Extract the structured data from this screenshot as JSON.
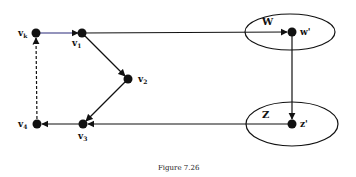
{
  "diagram": {
    "caption": "Figure 7.26",
    "colors": {
      "line": "#111111",
      "blue_edge": "#2a2a7a",
      "node": "#111111",
      "background": "#ffffff"
    },
    "nodes": [
      {
        "id": "vk",
        "label": "v",
        "sub": "k",
        "x": 36,
        "y": 33
      },
      {
        "id": "v1",
        "label": "v",
        "sub": "1",
        "x": 82,
        "y": 33
      },
      {
        "id": "v2",
        "label": "v",
        "sub": "2",
        "x": 128,
        "y": 79
      },
      {
        "id": "v3",
        "label": "v",
        "sub": "3",
        "x": 83,
        "y": 124
      },
      {
        "id": "v4",
        "label": "v",
        "sub": "4",
        "x": 37,
        "y": 124
      },
      {
        "id": "w_prime",
        "label": "w'",
        "x": 292,
        "y": 32
      },
      {
        "id": "z_prime",
        "label": "z'",
        "x": 292,
        "y": 124
      }
    ],
    "regions": [
      {
        "id": "W",
        "label": "W",
        "cx": 290,
        "cy": 32,
        "rx": 45,
        "ry": 18
      },
      {
        "id": "Z",
        "label": "Z",
        "cx": 292,
        "cy": 124,
        "rx": 46,
        "ry": 22
      }
    ],
    "edges": [
      {
        "from": "vk",
        "to": "v1",
        "style": "solid",
        "color": "blue"
      },
      {
        "from": "v1",
        "to": "w_prime",
        "style": "solid"
      },
      {
        "from": "v1",
        "to": "v2",
        "style": "solid"
      },
      {
        "from": "v2",
        "to": "v3",
        "style": "solid"
      },
      {
        "from": "w_prime",
        "to": "z_prime",
        "style": "solid"
      },
      {
        "from": "z_prime",
        "to": "v3",
        "style": "solid"
      },
      {
        "from": "v3",
        "to": "v4",
        "style": "solid"
      },
      {
        "from": "v4",
        "to": "vk",
        "style": "dashed"
      }
    ],
    "labels": {
      "vk": "v",
      "vk_sub": "k",
      "v1": "v",
      "v1_sub": "1",
      "v2": "v",
      "v2_sub": "2",
      "v3": "v",
      "v3_sub": "3",
      "v4": "v",
      "v4_sub": "4",
      "W": "W",
      "w_prime": "w'",
      "Z": "Z",
      "z_prime": "z'"
    }
  }
}
